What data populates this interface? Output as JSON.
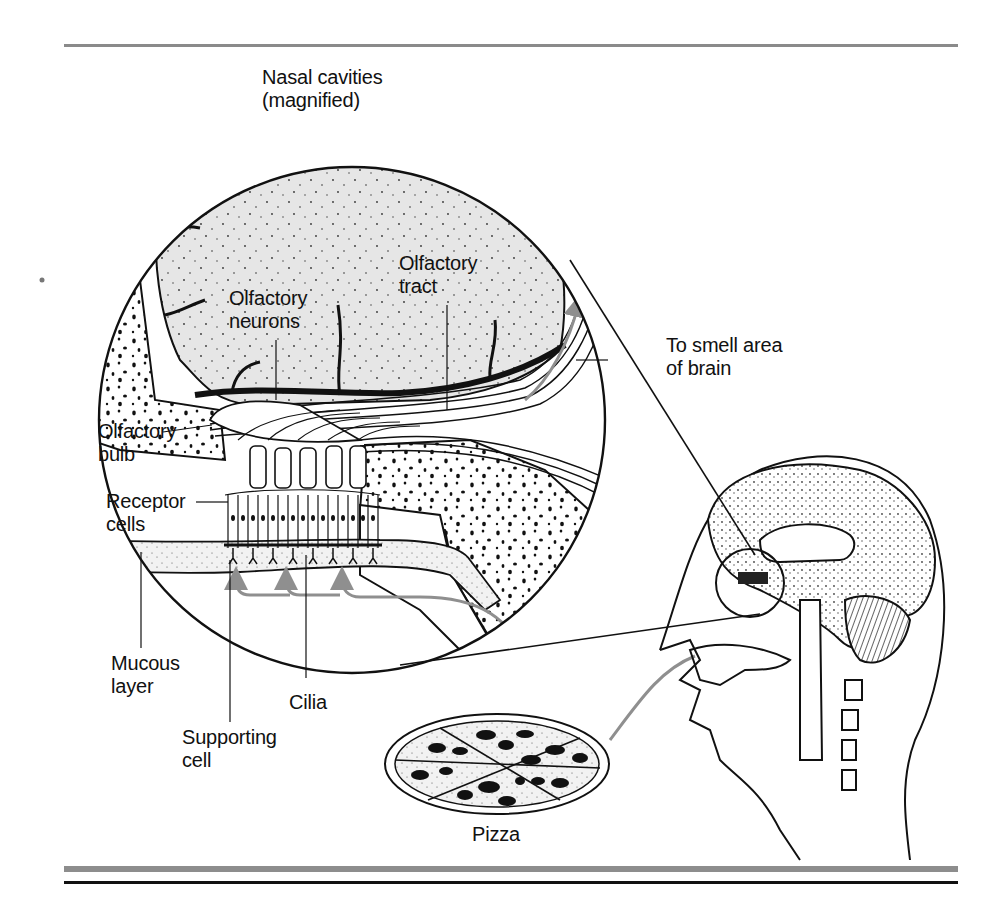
{
  "figure": {
    "title_label": {
      "line1": "Nasal cavities",
      "line2": "(magnified)"
    },
    "labels": {
      "olfactory_neurons": {
        "line1": "Olfactory",
        "line2": "neurons"
      },
      "olfactory_tract": {
        "line1": "Olfactory",
        "line2": "tract"
      },
      "to_smell_area": {
        "line1": "To smell area",
        "line2": "of brain"
      },
      "olfactory_bulb": {
        "line1": "Olfactory",
        "line2": "bulb"
      },
      "receptor_cells": {
        "line1": "Receptor",
        "line2": "cells"
      },
      "mucous_layer": {
        "line1": "Mucous",
        "line2": "layer"
      },
      "cilia": {
        "line1": "Cilia"
      },
      "supporting_cell": {
        "line1": "Supporting",
        "line2": "cell"
      },
      "pizza": {
        "line1": "Pizza"
      }
    },
    "colors": {
      "ink": "#111111",
      "brain_fill": "#e6e6e6",
      "arrow_gray": "#8f8f8f",
      "rule_gray": "#8a8a8a"
    }
  }
}
